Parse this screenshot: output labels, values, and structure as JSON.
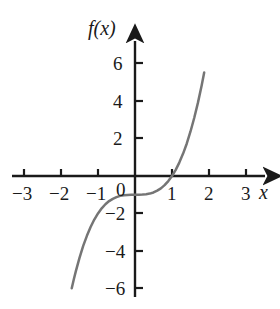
{
  "chart_data": {
    "type": "line",
    "title": "",
    "subtitle": "",
    "xlabel": "x",
    "ylabel": "f(x)",
    "xlim": [
      -3.6,
      3.7
    ],
    "ylim": [
      -6.9,
      7.3
    ],
    "grid": false,
    "legend": null,
    "xticks": [
      -3,
      -2,
      -1,
      1,
      2,
      3
    ],
    "xtick_labels": [
      "−3",
      "−2",
      "−1",
      "1",
      "2",
      "3"
    ],
    "yticks": [
      6,
      4,
      2,
      -2,
      -4,
      -6
    ],
    "ytick_labels": [
      "6",
      "4",
      "2",
      "−2",
      "−4",
      "−6"
    ],
    "origin_label": "0",
    "series": [
      {
        "name": "f(x) = x³ − 1",
        "color": "#757575",
        "x": [
          -1.71,
          -1.65,
          -1.6,
          -1.5,
          -1.4,
          -1.3,
          -1.2,
          -1.1,
          -1.0,
          -0.9,
          -0.8,
          -0.7,
          -0.6,
          -0.5,
          -0.4,
          -0.3,
          -0.2,
          -0.1,
          0.0,
          0.1,
          0.2,
          0.3,
          0.4,
          0.5,
          0.6,
          0.7,
          0.8,
          0.9,
          1.0,
          1.1,
          1.2,
          1.3,
          1.4,
          1.5,
          1.6,
          1.7,
          1.8,
          1.87
        ],
        "y": [
          -6.0,
          -5.49,
          -5.1,
          -4.38,
          -3.74,
          -3.2,
          -2.73,
          -2.33,
          -2.0,
          -1.73,
          -1.51,
          -1.34,
          -1.22,
          -1.13,
          -1.06,
          -1.03,
          -1.01,
          -1.0,
          -1.0,
          -1.0,
          -0.99,
          -0.97,
          -0.94,
          -0.88,
          -0.78,
          -0.66,
          -0.49,
          -0.27,
          0.0,
          0.33,
          0.73,
          1.2,
          1.74,
          2.38,
          3.1,
          3.91,
          4.83,
          5.54
        ]
      }
    ],
    "annotations": []
  },
  "axes": {
    "x_axis_arrow": "arrow-right",
    "y_axis_arrow": "arrow-up",
    "axis_color": "#1a1a1a"
  }
}
